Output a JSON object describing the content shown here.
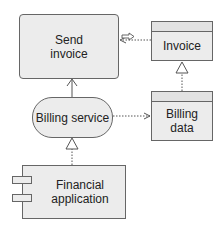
{
  "diagram": {
    "nodes": [
      {
        "id": "send-invoice",
        "label": "Send\ninvoice",
        "type": "business-process",
        "icon": "process-arrow-icon"
      },
      {
        "id": "invoice",
        "label": "Invoice",
        "type": "business-object"
      },
      {
        "id": "billing-service",
        "label": "Billing service",
        "type": "application-service"
      },
      {
        "id": "billing-data",
        "label": "Billing\ndata",
        "type": "data-object"
      },
      {
        "id": "financial-app",
        "label": "Financial\napplication",
        "type": "application-component",
        "icon": "component-icon"
      }
    ],
    "edges": [
      {
        "from": "billing-service",
        "to": "send-invoice",
        "style": "solid",
        "arrow": "open",
        "type": "used-by"
      },
      {
        "from": "invoice",
        "to": "send-invoice",
        "style": "dotted",
        "arrow": "open",
        "type": "access"
      },
      {
        "from": "billing-data",
        "to": "invoice",
        "style": "dotted",
        "arrow": "hollow-triangle",
        "type": "realization"
      },
      {
        "from": "billing-service",
        "to": "billing-data",
        "style": "dotted",
        "arrow": "open",
        "type": "access"
      },
      {
        "from": "financial-app",
        "to": "billing-service",
        "style": "dotted",
        "arrow": "hollow-triangle",
        "type": "realization"
      }
    ],
    "colors": {
      "fill": "#ececec",
      "stroke": "#666666",
      "text": "#222222"
    }
  }
}
